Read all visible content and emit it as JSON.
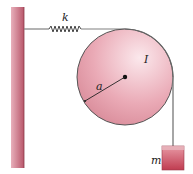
{
  "diagram": {
    "labels": {
      "spring": "k",
      "moment_of_inertia": "I",
      "radius": "a",
      "mass": "m"
    },
    "components": [
      {
        "name": "wall",
        "type": "fixed support"
      },
      {
        "name": "spring",
        "label": "k"
      },
      {
        "name": "pulley",
        "label": "I",
        "radius_label": "a"
      },
      {
        "name": "rope"
      },
      {
        "name": "hanging-mass",
        "label": "m"
      }
    ],
    "colors": {
      "wall": "#c96a7c",
      "pulley_fill": "#e8a4b0",
      "mass_fill": "#c84a5c",
      "rope": "#808080",
      "outline": "#444444"
    }
  }
}
